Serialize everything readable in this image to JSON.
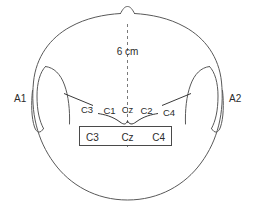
{
  "figure": {
    "distance_label": "6 cm",
    "ear_left_label": "A1",
    "ear_right_label": "A2",
    "scalp_row": {
      "labels": [
        "C3",
        "C1",
        "Cz",
        "C2",
        "C4"
      ]
    },
    "montage_box": {
      "labels": [
        "C3",
        "Cz",
        "C4"
      ]
    },
    "colors": {
      "outline": "#595959",
      "box_stroke": "#4a4a4a",
      "dashed": "#7a7a7a",
      "text": "#2b2b2b",
      "background": "#ffffff"
    }
  }
}
